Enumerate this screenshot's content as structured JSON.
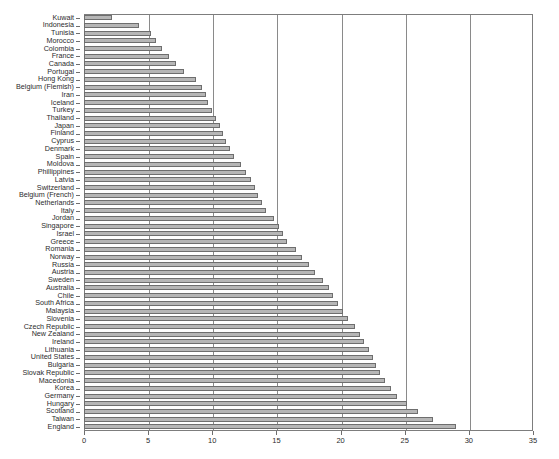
{
  "chart_data": {
    "type": "bar",
    "orientation": "horizontal",
    "title": "",
    "xlabel": "",
    "ylabel": "",
    "xlim": [
      0,
      35
    ],
    "xticks": [
      0,
      5,
      10,
      15,
      20,
      25,
      30,
      35
    ],
    "grid": true,
    "legend": false,
    "bar_color": "#b6b6b6",
    "bar_edge_color": "#6e6e6e",
    "categories": [
      "Kuwait",
      "Indonesia",
      "Tunisia",
      "Morocco",
      "Colombia",
      "France",
      "Canada",
      "Portugal",
      "Hong Kong",
      "Belgium (Flemish)",
      "Iran",
      "Iceland",
      "Turkey",
      "Thailand",
      "Japan",
      "Finland",
      "Cyprus",
      "Denmark",
      "Spain",
      "Moldova",
      "Phillippines",
      "Latvia",
      "Switzerland",
      "Belgium (French)",
      "Netherlands",
      "Italy",
      "Jordan",
      "Singapore",
      "Israel",
      "Greece",
      "Romania",
      "Norway",
      "Russia",
      "Austria",
      "Sweden",
      "Australia",
      "Chile",
      "South Africa",
      "Malaysia",
      "Slovenia",
      "Czech Republic",
      "New Zealand",
      "Ireland",
      "Lithuania",
      "United States",
      "Bulgaria",
      "Slovak Republic",
      "Macedonia",
      "Korea",
      "Germany",
      "Hungary",
      "Scotland",
      "Taiwan",
      "England"
    ],
    "values": [
      2.2,
      4.3,
      5.2,
      5.6,
      6.1,
      6.6,
      7.2,
      7.8,
      8.7,
      9.2,
      9.5,
      9.7,
      10.0,
      10.3,
      10.6,
      10.8,
      11.1,
      11.4,
      11.7,
      12.2,
      12.6,
      13.0,
      13.3,
      13.6,
      13.9,
      14.2,
      14.8,
      15.2,
      15.5,
      15.8,
      16.5,
      17.0,
      17.5,
      18.0,
      18.6,
      19.1,
      19.4,
      19.8,
      20.2,
      20.6,
      21.1,
      21.5,
      21.8,
      22.2,
      22.5,
      22.8,
      23.1,
      23.5,
      23.9,
      24.4,
      25.2,
      26.0,
      27.2,
      29.0
    ]
  }
}
